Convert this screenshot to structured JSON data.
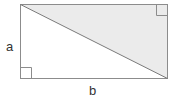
{
  "figure": {
    "canvas": {
      "width": 179,
      "height": 103,
      "background": "#ffffff"
    },
    "colors": {
      "stroke": "#8c8c8c",
      "diagonal_stroke": "#7a7a7a",
      "shaded_fill": "#ebebeb",
      "marker_stroke": "#8c8c8c",
      "label_color": "#333333"
    },
    "rectangle": {
      "x1": 20,
      "y1": 4,
      "x2": 168,
      "y2": 79,
      "width": 148,
      "height": 75,
      "stroke_width": 1
    },
    "diagonal": {
      "from_x": 20,
      "from_y": 4,
      "to_x": 168,
      "to_y": 79,
      "stroke_width": 1
    },
    "shaded_triangle": {
      "points": "20,4 168,4 168,79",
      "fill": "#ebebeb",
      "description": "upper-right triangle"
    },
    "right_angle_markers": [
      {
        "name": "top-right-corner",
        "x": 157,
        "y": 4,
        "size": 11
      },
      {
        "name": "bottom-left-corner",
        "x": 20,
        "y": 68,
        "size": 11
      }
    ],
    "labels": {
      "side_a": "a",
      "side_b": "b"
    }
  }
}
